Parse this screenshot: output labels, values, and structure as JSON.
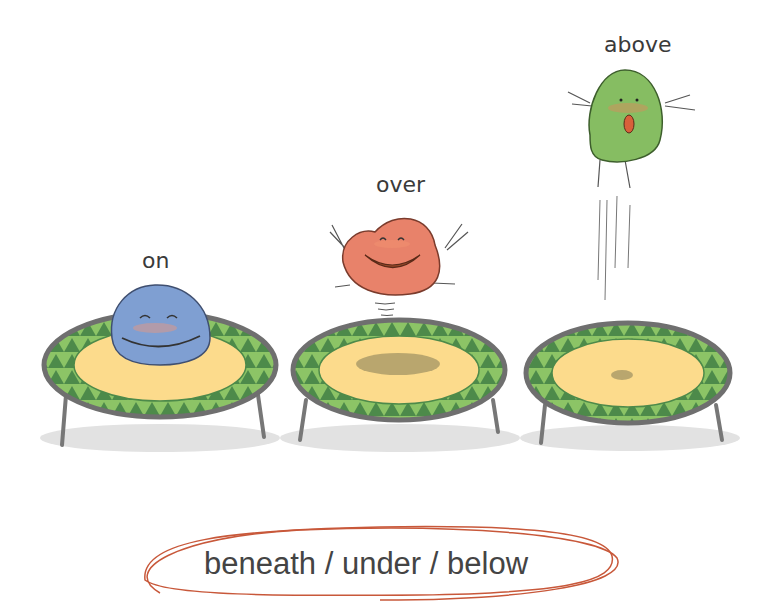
{
  "labels": {
    "on": "on",
    "over": "over",
    "above": "above",
    "caption": "beneath / under / below"
  },
  "characters": [
    {
      "name": "blue-blob",
      "position": "on",
      "color": "#7f9fd2"
    },
    {
      "name": "red-blob",
      "position": "over",
      "color": "#e8826a"
    },
    {
      "name": "green-blob",
      "position": "above",
      "color": "#86bd62"
    }
  ],
  "colors": {
    "mat": "#fcdb8c",
    "frame_light": "#8cc466",
    "frame_dark": "#4d8a4a",
    "rim": "#777777",
    "shadow": "#e3e3e3",
    "caption_ring": "#c8583a"
  }
}
